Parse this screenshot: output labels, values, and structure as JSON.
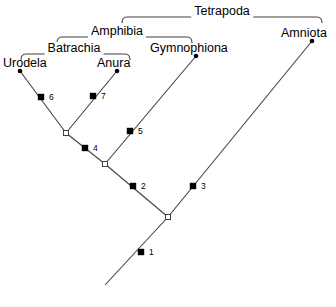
{
  "diagram": {
    "type": "cladogram",
    "colors": {
      "line": "#404040",
      "tip_dot": "#000000",
      "synapomorphy_marker": "#000000",
      "node_open": "#ffffff",
      "node_outline": "#404040",
      "background": "#ffffff",
      "text": "#000000"
    }
  },
  "taxa": [
    {
      "id": "urodela",
      "label": "Urodela",
      "label_x": 3,
      "label_y": 57,
      "tip_x": 20,
      "tip_y": 71
    },
    {
      "id": "anura",
      "label": "Anura",
      "label_x": 97,
      "label_y": 57,
      "tip_x": 117,
      "tip_y": 71
    },
    {
      "id": "gymnophiona",
      "label": "Gymnophiona",
      "label_x": 150,
      "label_y": 42,
      "tip_x": 196,
      "tip_y": 56
    },
    {
      "id": "amniota",
      "label": "Amniota",
      "label_x": 281,
      "label_y": 27,
      "tip_x": 312,
      "tip_y": 41
    }
  ],
  "clades": [
    {
      "id": "tetrapoda",
      "label": "Tetrapoda",
      "left": 122,
      "right": 322,
      "y": 17,
      "label_x": 222,
      "label_y": 5
    },
    {
      "id": "amphibia",
      "label": "Amphibia",
      "left": 57,
      "right": 192,
      "y": 37,
      "label_x": 117,
      "label_y": 25
    },
    {
      "id": "batrachia",
      "label": "Batrachia",
      "left": 21,
      "right": 130,
      "y": 54,
      "label_x": 74,
      "label_y": 42
    }
  ],
  "nodes": [
    {
      "id": "node-batrachia",
      "kind": "open-circle",
      "x": 66,
      "y": 133
    },
    {
      "id": "node-amphibia",
      "kind": "open-circle",
      "x": 105,
      "y": 164
    },
    {
      "id": "node-tetrapoda",
      "kind": "open-circle",
      "x": 168,
      "y": 217
    }
  ],
  "branches": [
    {
      "id": "branch-urodela",
      "x1": 20,
      "y1": 71,
      "x2": 66,
      "y2": 133
    },
    {
      "id": "branch-anura",
      "x1": 117,
      "y1": 71,
      "x2": 66,
      "y2": 133
    },
    {
      "id": "branch-batrachia",
      "x1": 66,
      "y1": 133,
      "x2": 105,
      "y2": 164
    },
    {
      "id": "branch-gymnophiona",
      "x1": 196,
      "y1": 56,
      "x2": 105,
      "y2": 164
    },
    {
      "id": "branch-amphibia",
      "x1": 105,
      "y1": 164,
      "x2": 168,
      "y2": 217
    },
    {
      "id": "branch-amniota",
      "x1": 312,
      "y1": 41,
      "x2": 168,
      "y2": 217
    },
    {
      "id": "branch-root",
      "x1": 168,
      "y1": 217,
      "x2": 105,
      "y2": 285
    }
  ],
  "markers": [
    {
      "id": "marker-1",
      "number": "1",
      "x": 141,
      "y": 252,
      "label_x": 149,
      "label_y": 248
    },
    {
      "id": "marker-2",
      "number": "2",
      "x": 133,
      "y": 186,
      "label_x": 141,
      "label_y": 182
    },
    {
      "id": "marker-3",
      "number": "3",
      "x": 193,
      "y": 186,
      "label_x": 201,
      "label_y": 182
    },
    {
      "id": "marker-4",
      "number": "4",
      "x": 85,
      "y": 148,
      "label_x": 93,
      "label_y": 144
    },
    {
      "id": "marker-5",
      "number": "5",
      "x": 130,
      "y": 131,
      "label_x": 138,
      "label_y": 127
    },
    {
      "id": "marker-6",
      "number": "6",
      "x": 41,
      "y": 97,
      "label_x": 49,
      "label_y": 93
    },
    {
      "id": "marker-7",
      "number": "7",
      "x": 93,
      "y": 96,
      "label_x": 101,
      "label_y": 92
    }
  ]
}
